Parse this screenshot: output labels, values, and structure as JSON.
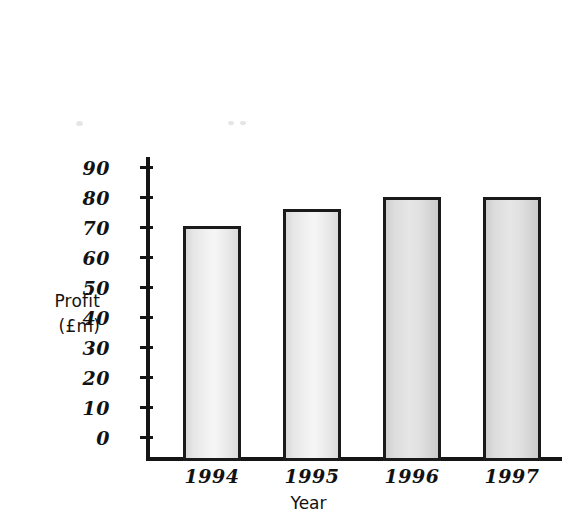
{
  "chart_data": {
    "type": "bar",
    "title": "",
    "xlabel": "Year",
    "ylabel": "Profit (£m)",
    "ylabel_lines": [
      "Profit",
      "(£m)"
    ],
    "categories": [
      "1994",
      "1995",
      "1996",
      "1997"
    ],
    "values": [
      72,
      77.5,
      83,
      87
    ],
    "ylim": [
      0,
      90
    ],
    "ytick_labels": [
      "90",
      "80",
      "70",
      "60",
      "50",
      "40",
      "30",
      "20",
      "10",
      "0"
    ],
    "ytick_values": [
      90,
      80,
      70,
      60,
      50,
      40,
      30,
      20,
      10,
      0
    ],
    "ytick_step": 10,
    "grid": false,
    "legend": false,
    "series": [
      {
        "name": "Profit",
        "values": [
          72,
          77.5,
          83,
          87
        ]
      }
    ],
    "bar_fill_color": "#eeeeee",
    "bar_edge_color": "#1a1a1a",
    "background_color": "#ffffff"
  }
}
